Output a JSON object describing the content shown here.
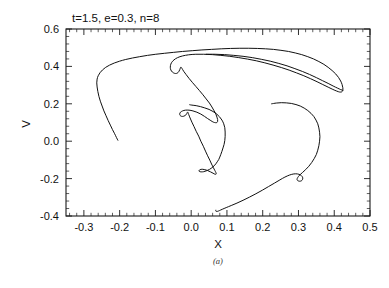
{
  "figure": {
    "caption": "(a)",
    "title": "t=1.5,  e=0.3,  n=8"
  },
  "axes": {
    "xlabel": "X",
    "ylabel": "V",
    "x_ticks": [
      "-0.3",
      "-0.2",
      "-0.1",
      "0.0",
      "0.1",
      "0.2",
      "0.3",
      "0.4",
      "0.5"
    ],
    "y_ticks": [
      "0.6",
      "0.4",
      "0.2",
      "0.0",
      "-0.2",
      "-0.4"
    ]
  },
  "chart_data": {
    "type": "line",
    "title": "t=1.5,  e=0.3,  n=8",
    "subtitle": "(a)",
    "xlabel": "X",
    "ylabel": "V",
    "xlim": [
      -0.35,
      0.5
    ],
    "ylim": [
      -0.4,
      0.6
    ],
    "xticks": [
      -0.3,
      -0.2,
      -0.1,
      0.0,
      0.1,
      0.2,
      0.3,
      0.4,
      0.5
    ],
    "yticks": [
      -0.4,
      -0.2,
      0.0,
      0.2,
      0.4,
      0.6
    ],
    "x_minor_tick_step": 0.02,
    "y_minor_tick_step": 0.04,
    "grid": false,
    "legend": null,
    "line_color": "#111111",
    "line_width": 1.0,
    "annotations": [
      {
        "text": "t=1.5,  e=0.3,  n=8",
        "position": "above-axes-left"
      },
      {
        "text": "(a)",
        "position": "below-xlabel-center"
      }
    ],
    "series": [
      {
        "name": "phase-space-filament",
        "comment": "Single continuous rolled-up phase space contour (water-bag / vortex roll), traced from the left tail through the outer arc, the far-right double-folded tip, the central S-fold, the inner hook and the lower right lobe.",
        "points": [
          [
            -0.205,
            0.005
          ],
          [
            -0.209,
            0.02
          ],
          [
            -0.214,
            0.04
          ],
          [
            -0.22,
            0.062
          ],
          [
            -0.226,
            0.086
          ],
          [
            -0.232,
            0.11
          ],
          [
            -0.238,
            0.136
          ],
          [
            -0.244,
            0.162
          ],
          [
            -0.249,
            0.188
          ],
          [
            -0.254,
            0.214
          ],
          [
            -0.258,
            0.24
          ],
          [
            -0.261,
            0.266
          ],
          [
            -0.263,
            0.29
          ],
          [
            -0.264,
            0.312
          ],
          [
            -0.263,
            0.332
          ],
          [
            -0.26,
            0.35
          ],
          [
            -0.255,
            0.366
          ],
          [
            -0.248,
            0.381
          ],
          [
            -0.239,
            0.395
          ],
          [
            -0.228,
            0.407
          ],
          [
            -0.215,
            0.418
          ],
          [
            -0.2,
            0.428
          ],
          [
            -0.183,
            0.437
          ],
          [
            -0.164,
            0.445
          ],
          [
            -0.144,
            0.452
          ],
          [
            -0.122,
            0.459
          ],
          [
            -0.099,
            0.465
          ],
          [
            -0.075,
            0.47
          ],
          [
            -0.05,
            0.475
          ],
          [
            -0.024,
            0.48
          ],
          [
            0.003,
            0.484
          ],
          [
            0.03,
            0.488
          ],
          [
            0.057,
            0.491
          ],
          [
            0.084,
            0.494
          ],
          [
            0.11,
            0.496
          ],
          [
            0.136,
            0.497
          ],
          [
            0.161,
            0.497
          ],
          [
            0.185,
            0.496
          ],
          [
            0.208,
            0.494
          ],
          [
            0.23,
            0.491
          ],
          [
            0.251,
            0.486
          ],
          [
            0.272,
            0.48
          ],
          [
            0.291,
            0.472
          ],
          [
            0.309,
            0.463
          ],
          [
            0.326,
            0.452
          ],
          [
            0.342,
            0.44
          ],
          [
            0.357,
            0.426
          ],
          [
            0.371,
            0.411
          ],
          [
            0.383,
            0.395
          ],
          [
            0.394,
            0.378
          ],
          [
            0.404,
            0.36
          ],
          [
            0.412,
            0.341
          ],
          [
            0.418,
            0.322
          ],
          [
            0.422,
            0.303
          ],
          [
            0.424,
            0.286
          ],
          [
            0.424,
            0.272
          ],
          [
            0.421,
            0.264
          ],
          [
            0.415,
            0.263
          ],
          [
            0.407,
            0.268
          ],
          [
            0.396,
            0.277
          ],
          [
            0.383,
            0.289
          ],
          [
            0.368,
            0.303
          ],
          [
            0.352,
            0.318
          ],
          [
            0.334,
            0.334
          ],
          [
            0.315,
            0.35
          ],
          [
            0.295,
            0.365
          ],
          [
            0.274,
            0.38
          ],
          [
            0.252,
            0.394
          ],
          [
            0.229,
            0.407
          ],
          [
            0.206,
            0.419
          ],
          [
            0.182,
            0.43
          ],
          [
            0.158,
            0.439
          ],
          [
            0.133,
            0.447
          ],
          [
            0.108,
            0.454
          ],
          [
            0.083,
            0.459
          ],
          [
            0.059,
            0.463
          ],
          [
            0.035,
            0.465
          ],
          [
            0.013,
            0.465
          ],
          [
            -0.007,
            0.462
          ],
          [
            -0.024,
            0.456
          ],
          [
            -0.038,
            0.447
          ],
          [
            -0.048,
            0.435
          ],
          [
            -0.055,
            0.42
          ],
          [
            -0.058,
            0.404
          ],
          [
            -0.058,
            0.388
          ],
          [
            -0.055,
            0.375
          ],
          [
            -0.05,
            0.366
          ],
          [
            -0.044,
            0.362
          ],
          [
            -0.039,
            0.364
          ],
          [
            -0.035,
            0.371
          ],
          [
            -0.032,
            0.382
          ],
          [
            -0.029,
            0.396
          ],
          [
            -0.026,
            0.39
          ],
          [
            -0.021,
            0.374
          ],
          [
            -0.014,
            0.356
          ],
          [
            -0.006,
            0.336
          ],
          [
            0.003,
            0.315
          ],
          [
            0.013,
            0.293
          ],
          [
            0.023,
            0.271
          ],
          [
            0.033,
            0.248
          ],
          [
            0.042,
            0.226
          ],
          [
            0.051,
            0.204
          ],
          [
            0.058,
            0.183
          ],
          [
            0.064,
            0.163
          ],
          [
            0.069,
            0.145
          ],
          [
            0.072,
            0.129
          ],
          [
            0.074,
            0.116
          ],
          [
            0.074,
            0.106
          ],
          [
            0.072,
            0.1
          ],
          [
            0.068,
            0.099
          ],
          [
            0.062,
            0.102
          ],
          [
            0.055,
            0.11
          ],
          [
            0.046,
            0.121
          ],
          [
            0.037,
            0.133
          ],
          [
            0.027,
            0.145
          ],
          [
            0.016,
            0.155
          ],
          [
            0.005,
            0.162
          ],
          [
            -0.006,
            0.166
          ],
          [
            -0.016,
            0.166
          ],
          [
            -0.024,
            0.162
          ],
          [
            -0.03,
            0.155
          ],
          [
            -0.032,
            0.146
          ],
          [
            -0.031,
            0.138
          ],
          [
            -0.027,
            0.133
          ],
          [
            -0.022,
            0.133
          ],
          [
            -0.017,
            0.137
          ],
          [
            -0.013,
            0.145
          ],
          [
            -0.01,
            0.156
          ],
          [
            -0.007,
            0.143
          ],
          [
            -0.003,
            0.124
          ],
          [
            0.002,
            0.102
          ],
          [
            0.008,
            0.078
          ],
          [
            0.014,
            0.053
          ],
          [
            0.021,
            0.027
          ],
          [
            0.027,
            0.0
          ],
          [
            0.034,
            -0.027
          ],
          [
            0.04,
            -0.053
          ],
          [
            0.046,
            -0.078
          ],
          [
            0.052,
            -0.101
          ],
          [
            0.057,
            -0.122
          ],
          [
            0.062,
            -0.141
          ],
          [
            0.066,
            -0.156
          ],
          [
            0.069,
            -0.167
          ],
          [
            0.07,
            -0.174
          ],
          [
            0.069,
            -0.177
          ],
          [
            0.066,
            -0.176
          ],
          [
            0.061,
            -0.171
          ],
          [
            0.054,
            -0.164
          ],
          [
            0.046,
            -0.157
          ],
          [
            0.038,
            -0.152
          ],
          [
            0.031,
            -0.15
          ],
          [
            0.025,
            -0.152
          ],
          [
            0.022,
            -0.157
          ],
          [
            0.023,
            -0.162
          ],
          [
            0.028,
            -0.164
          ],
          [
            0.035,
            -0.163
          ],
          [
            0.043,
            -0.158
          ],
          [
            0.051,
            -0.151
          ],
          [
            0.058,
            -0.142
          ],
          [
            0.064,
            -0.132
          ],
          [
            0.069,
            -0.121
          ],
          [
            0.073,
            -0.11
          ],
          [
            0.077,
            -0.098
          ],
          [
            0.08,
            -0.085
          ],
          [
            0.083,
            -0.07
          ],
          [
            0.086,
            -0.054
          ],
          [
            0.089,
            -0.036
          ],
          [
            0.092,
            -0.017
          ],
          [
            0.094,
            0.004
          ],
          [
            0.095,
            0.026
          ],
          [
            0.095,
            0.049
          ],
          [
            0.094,
            0.072
          ],
          [
            0.091,
            0.093
          ],
          [
            0.086,
            0.113
          ],
          [
            0.079,
            0.131
          ],
          [
            0.071,
            0.146
          ],
          [
            0.061,
            0.159
          ],
          [
            0.05,
            0.17
          ],
          [
            0.038,
            0.178
          ],
          [
            0.026,
            0.185
          ],
          [
            0.014,
            0.19
          ],
          [
            0.002,
            0.193
          ],
          [
            -0.004,
            0.195
          ]
        ],
        "secondary_branches": [
          {
            "name": "outer-tip-lower-strand",
            "points": [
              [
                0.424,
                0.272
              ],
              [
                0.418,
                0.276
              ],
              [
                0.409,
                0.284
              ],
              [
                0.397,
                0.295
              ],
              [
                0.383,
                0.309
              ],
              [
                0.367,
                0.324
              ],
              [
                0.35,
                0.34
              ],
              [
                0.331,
                0.357
              ],
              [
                0.311,
                0.373
              ],
              [
                0.29,
                0.388
              ],
              [
                0.268,
                0.403
              ],
              [
                0.245,
                0.416
              ],
              [
                0.221,
                0.428
              ],
              [
                0.196,
                0.438
              ],
              [
                0.171,
                0.447
              ],
              [
                0.145,
                0.454
              ],
              [
                0.119,
                0.459
              ],
              [
                0.093,
                0.463
              ],
              [
                0.067,
                0.465
              ],
              [
                0.042,
                0.465
              ]
            ]
          },
          {
            "name": "lower-right-lobe",
            "points": [
              [
                0.225,
                0.2
              ],
              [
                0.238,
                0.204
              ],
              [
                0.252,
                0.206
              ],
              [
                0.266,
                0.205
              ],
              [
                0.28,
                0.202
              ],
              [
                0.293,
                0.196
              ],
              [
                0.305,
                0.188
              ],
              [
                0.316,
                0.177
              ],
              [
                0.326,
                0.164
              ],
              [
                0.335,
                0.149
              ],
              [
                0.343,
                0.132
              ],
              [
                0.349,
                0.113
              ],
              [
                0.354,
                0.093
              ],
              [
                0.357,
                0.071
              ],
              [
                0.359,
                0.048
              ],
              [
                0.36,
                0.024
              ],
              [
                0.359,
                0.0
              ],
              [
                0.357,
                -0.024
              ],
              [
                0.354,
                -0.048
              ],
              [
                0.35,
                -0.071
              ],
              [
                0.344,
                -0.093
              ],
              [
                0.337,
                -0.114
              ],
              [
                0.329,
                -0.134
              ],
              [
                0.32,
                -0.152
              ],
              [
                0.311,
                -0.168
              ],
              [
                0.303,
                -0.182
              ],
              [
                0.298,
                -0.194
              ],
              [
                0.296,
                -0.204
              ],
              [
                0.298,
                -0.211
              ],
              [
                0.303,
                -0.214
              ],
              [
                0.308,
                -0.212
              ],
              [
                0.311,
                -0.206
              ],
              [
                0.312,
                -0.197
              ],
              [
                0.31,
                -0.188
              ],
              [
                0.305,
                -0.18
              ],
              [
                0.297,
                -0.175
              ],
              [
                0.287,
                -0.175
              ],
              [
                0.275,
                -0.181
              ],
              [
                0.262,
                -0.192
              ],
              [
                0.248,
                -0.207
              ],
              [
                0.233,
                -0.224
              ],
              [
                0.216,
                -0.243
              ],
              [
                0.199,
                -0.262
              ],
              [
                0.181,
                -0.281
              ],
              [
                0.163,
                -0.299
              ],
              [
                0.145,
                -0.316
              ],
              [
                0.128,
                -0.331
              ],
              [
                0.112,
                -0.344
              ],
              [
                0.098,
                -0.355
              ],
              [
                0.087,
                -0.364
              ],
              [
                0.079,
                -0.371
              ],
              [
                0.074,
                -0.375
              ],
              [
                0.071,
                -0.376
              ],
              [
                0.069,
                -0.374
              ],
              [
                0.069,
                -0.369
              ]
            ]
          }
        ]
      }
    ]
  }
}
